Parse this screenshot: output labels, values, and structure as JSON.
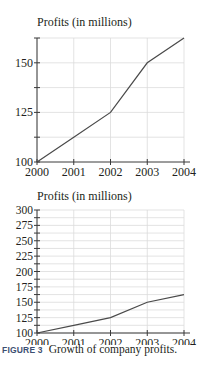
{
  "chart_data": [
    {
      "type": "line",
      "title": "",
      "ylabel": "Profits (in millions)",
      "xlabel": "",
      "categories": [
        "2000",
        "2001",
        "2002",
        "2003",
        "2004"
      ],
      "x": [
        2000,
        2001,
        2002,
        2003,
        2004
      ],
      "values": [
        100,
        112.5,
        125,
        150,
        162.5
      ],
      "ylim": [
        100,
        162.5
      ],
      "yticks_labeled": [
        100,
        125,
        150
      ],
      "yticks_minor": [
        112.5,
        137.5,
        162.5
      ],
      "grid": true,
      "legend": null
    },
    {
      "type": "line",
      "title": "",
      "ylabel": "Profits (in millions)",
      "xlabel": "",
      "categories": [
        "2000",
        "2001",
        "2002",
        "2003",
        "2004"
      ],
      "x": [
        2000,
        2001,
        2002,
        2003,
        2004
      ],
      "values": [
        100,
        112.5,
        125,
        150,
        162.5
      ],
      "ylim": [
        100,
        300
      ],
      "yticks_labeled": [
        100,
        125,
        150,
        175,
        200,
        225,
        250,
        275,
        300
      ],
      "grid": true,
      "legend": null
    }
  ],
  "figure": {
    "label": "FIGURE 3",
    "caption": "Growth of company profits."
  },
  "colors": {
    "line": "#4a4a4a",
    "axis": "#3a3a3a",
    "grid": "#dcdcdc",
    "caption_label": "#3d4f72"
  }
}
